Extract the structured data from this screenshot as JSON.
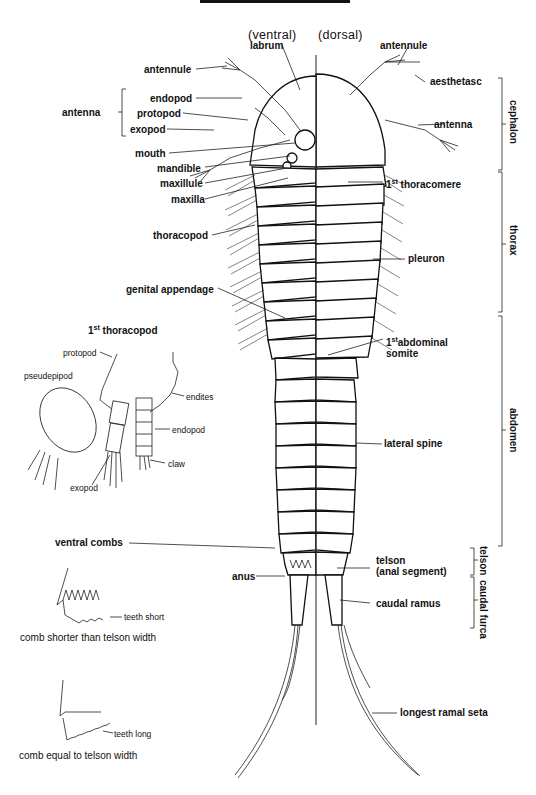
{
  "diagram": {
    "type": "anatomical-diagram",
    "view_labels": {
      "ventral": "(ventral)",
      "dorsal": "(dorsal)"
    },
    "left_labels": {
      "labrum": "labrum",
      "antennule": "antennule",
      "antenna_group": "antenna",
      "endopod": "endopod",
      "protopod": "protopod",
      "exopod": "exopod",
      "mouth": "mouth",
      "mandible": "mandible",
      "maxillule": "maxillule",
      "maxilla": "maxilla",
      "thoracopod": "thoracopod",
      "genital_appendage": "genital appendage",
      "ventral_combs": "ventral combs",
      "anus": "anus"
    },
    "right_labels": {
      "antennule": "antennule",
      "aesthetasc": "aesthetasc",
      "antenna": "antenna",
      "thoracomere_num": "1",
      "thoracomere_sup": "st",
      "thoracomere": " thoracomere",
      "pleuron": "pleuron",
      "abdominal_num": "1",
      "abdominal_sup": "st",
      "abdominal_line1": "abdominal",
      "abdominal_line2": "somite",
      "lateral_spine": "lateral spine",
      "telson_line1": "telson",
      "telson_line2": "(anal segment)",
      "caudal_ramus": "caudal ramus",
      "longest_ramal_seta": "longest ramal seta"
    },
    "regions": {
      "cephalon": "cephalon",
      "thorax": "thorax",
      "abdomen": "abdomen",
      "telson": "telson",
      "caudal_furca": "caudal furca"
    },
    "inset_thoracopod": {
      "title_num": "1",
      "title_sup": "st",
      "title": " thoracopod",
      "protopod": "protopod",
      "pseudepipod": "pseudepipod",
      "endites": "endites",
      "endopod": "endopod",
      "claw": "claw",
      "exopod": "exopod"
    },
    "inset_combs": {
      "short_label": "teeth short",
      "short_caption": "comb shorter than telson width",
      "long_label": "teeth long",
      "long_caption": "comb equal to telson width"
    }
  }
}
